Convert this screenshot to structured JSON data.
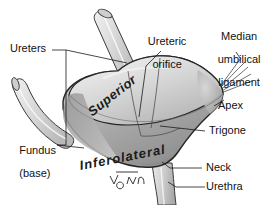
{
  "figure": {
    "signature": "V.Oxorn",
    "background_color": "#ffffff",
    "line_color": "#1a1a1a",
    "organ_fill_light": "#e8e8e8",
    "organ_fill_mid": "#bdbdbd",
    "organ_fill_dark": "#8f8f8f",
    "tube_fill": "#d9d9d9"
  },
  "labels": {
    "ureters": "Ureters",
    "ureteric_orifice_line1": "Ureteric",
    "ureteric_orifice_line2": "orifice",
    "median_umbilical_line1": "Median",
    "median_umbilical_line2": "umbilical",
    "median_umbilical_line3": "ligament",
    "apex": "Apex",
    "trigone": "Trigone",
    "neck": "Neck",
    "urethra": "Urethra",
    "fundus_line1": "Fundus",
    "fundus_line2": "(base)"
  },
  "surfaces": {
    "superior": "Superior",
    "inferolateral": "Inferolateral"
  }
}
